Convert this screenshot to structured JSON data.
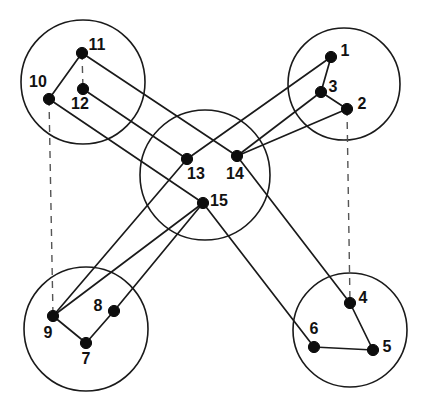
{
  "figure": {
    "background_color": "#ffffff",
    "node_color": "#0d0d0d",
    "edge_color": "#1a1a1a",
    "dashed_edge_color": "#555555",
    "width": 433,
    "height": 409
  },
  "clusters": [
    {
      "id": "cluster-top-left",
      "name": "top-left-cluster",
      "cx": 83,
      "cy": 82,
      "r": 62
    },
    {
      "id": "cluster-top-right",
      "name": "top-right-cluster",
      "cx": 344,
      "cy": 84,
      "r": 56
    },
    {
      "id": "cluster-center",
      "name": "center-cluster",
      "cx": 205,
      "cy": 175,
      "r": 65
    },
    {
      "id": "cluster-bottom-left",
      "name": "bottom-left-cluster",
      "cx": 86,
      "cy": 329,
      "r": 62
    },
    {
      "id": "cluster-bottom-right",
      "name": "bottom-right-cluster",
      "cx": 350,
      "cy": 330,
      "r": 57
    }
  ],
  "nodes": [
    {
      "id": 1,
      "label": "1",
      "x": 331,
      "y": 57,
      "lx": 345,
      "ly": 52,
      "cluster": "top-right"
    },
    {
      "id": 2,
      "label": "2",
      "x": 347,
      "y": 109,
      "lx": 362,
      "ly": 105,
      "cluster": "top-right"
    },
    {
      "id": 3,
      "label": "3",
      "x": 321,
      "y": 92,
      "lx": 333,
      "ly": 88,
      "cluster": "top-right"
    },
    {
      "id": 4,
      "label": "4",
      "x": 350,
      "y": 303,
      "lx": 363,
      "ly": 299,
      "cluster": "bottom-right"
    },
    {
      "id": 5,
      "label": "5",
      "x": 373,
      "y": 350,
      "lx": 387,
      "ly": 348,
      "cluster": "bottom-right"
    },
    {
      "id": 6,
      "label": "6",
      "x": 314,
      "y": 347,
      "lx": 314,
      "ly": 330,
      "cluster": "bottom-right"
    },
    {
      "id": 7,
      "label": "7",
      "x": 86,
      "y": 343,
      "lx": 86,
      "ly": 360,
      "cluster": "bottom-left"
    },
    {
      "id": 8,
      "label": "8",
      "x": 114,
      "y": 311,
      "lx": 98,
      "ly": 307,
      "cluster": "bottom-left"
    },
    {
      "id": 9,
      "label": "9",
      "x": 53,
      "y": 316,
      "lx": 48,
      "ly": 334,
      "cluster": "bottom-left"
    },
    {
      "id": 10,
      "label": "10",
      "x": 49,
      "y": 99,
      "lx": 38,
      "ly": 83,
      "cluster": "top-left"
    },
    {
      "id": 11,
      "label": "11",
      "x": 82,
      "y": 53,
      "lx": 97,
      "ly": 46,
      "cluster": "top-left"
    },
    {
      "id": 12,
      "label": "12",
      "x": 83,
      "y": 89,
      "lx": 80,
      "ly": 105,
      "cluster": "top-left"
    },
    {
      "id": 13,
      "label": "13",
      "x": 187,
      "y": 159,
      "lx": 196,
      "ly": 175,
      "cluster": "center"
    },
    {
      "id": 14,
      "label": "14",
      "x": 237,
      "y": 156,
      "lx": 235,
      "ly": 175,
      "cluster": "center"
    },
    {
      "id": 15,
      "label": "15",
      "x": 203,
      "y": 203,
      "lx": 219,
      "ly": 202,
      "cluster": "center"
    }
  ],
  "edges": [
    {
      "from": 1,
      "to": 3,
      "style": "solid",
      "name": "edge-1-3"
    },
    {
      "from": 3,
      "to": 2,
      "style": "solid",
      "name": "edge-3-2"
    },
    {
      "from": 1,
      "to": 13,
      "style": "solid",
      "name": "edge-1-13"
    },
    {
      "from": 3,
      "to": 14,
      "style": "solid",
      "name": "edge-3-14"
    },
    {
      "from": 2,
      "to": 14,
      "style": "solid",
      "name": "edge-2-14"
    },
    {
      "from": 11,
      "to": 10,
      "style": "solid",
      "name": "edge-11-10"
    },
    {
      "from": 11,
      "to": 14,
      "style": "solid",
      "name": "edge-11-14"
    },
    {
      "from": 12,
      "to": 13,
      "style": "solid",
      "name": "edge-12-13"
    },
    {
      "from": 10,
      "to": 15,
      "style": "solid",
      "name": "edge-10-15"
    },
    {
      "from": 13,
      "to": 9,
      "style": "solid",
      "name": "edge-13-9"
    },
    {
      "from": 15,
      "to": 9,
      "style": "solid",
      "name": "edge-15-9"
    },
    {
      "from": 15,
      "to": 8,
      "style": "solid",
      "name": "edge-15-8"
    },
    {
      "from": 14,
      "to": 4,
      "style": "solid",
      "name": "edge-14-4"
    },
    {
      "from": 15,
      "to": 6,
      "style": "solid",
      "name": "edge-15-6"
    },
    {
      "from": 9,
      "to": 7,
      "style": "solid",
      "name": "edge-9-7"
    },
    {
      "from": 7,
      "to": 8,
      "style": "solid",
      "name": "edge-7-8"
    },
    {
      "from": 4,
      "to": 5,
      "style": "solid",
      "name": "edge-4-5"
    },
    {
      "from": 6,
      "to": 5,
      "style": "solid",
      "name": "edge-6-5"
    },
    {
      "from": 11,
      "to": 12,
      "style": "dashed",
      "name": "edge-11-12-dashed"
    },
    {
      "from": 10,
      "to": 9,
      "style": "dashed",
      "name": "edge-10-9-dashed"
    },
    {
      "from": 2,
      "to": 4,
      "style": "dashed",
      "name": "edge-2-4-dashed"
    }
  ]
}
